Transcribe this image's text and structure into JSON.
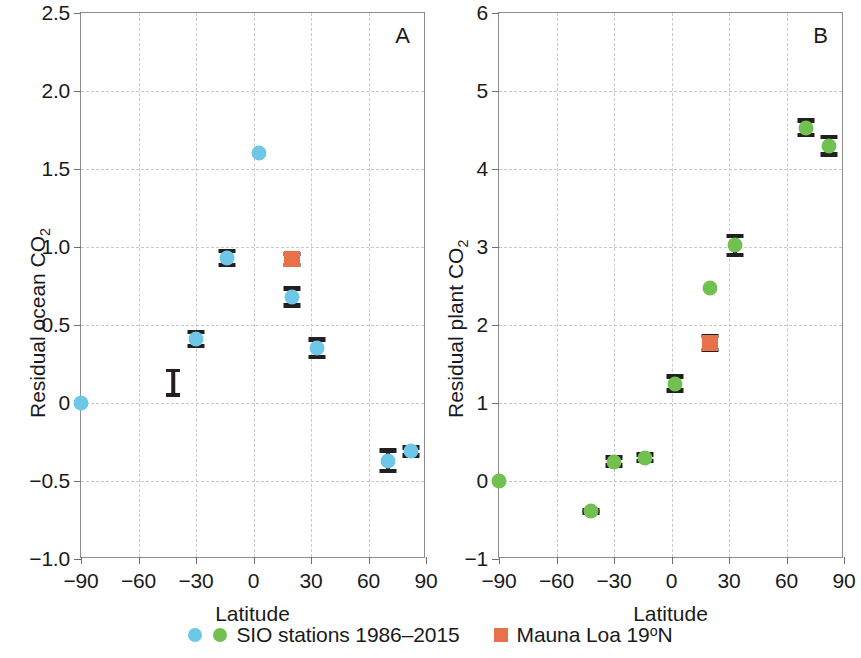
{
  "figure": {
    "width": 861,
    "height": 658,
    "colors": {
      "ocean_blue": "#6FC7E8",
      "plant_green": "#72C150",
      "mauna_loa_orange": "#E8714A",
      "errorbar_black": "#231f20",
      "grid_gray": "#c9c9c9",
      "axis_gray": "#8d8d8d"
    }
  },
  "legend": {
    "items": [
      {
        "id": "sio-stations",
        "marker": "circle-pair",
        "marker_colors": [
          "#6FC7E8",
          "#72C150"
        ],
        "label": "SIO stations 1986–2015"
      },
      {
        "id": "mauna-loa",
        "marker": "square",
        "marker_colors": [
          "#E8714A"
        ],
        "label_prefix": "Mauna Loa 19",
        "label_sup": "o",
        "label_suffix": "N",
        "label": "Mauna Loa 19°N"
      }
    ]
  },
  "chart_data": [
    {
      "id": "panel-a",
      "panel_letter": "A",
      "type": "scatter",
      "title": "",
      "xlabel": "Latitude",
      "ylabel_prefix": "Residual ocean CO",
      "ylabel_sub": "2",
      "ylabel": "Residual ocean CO2",
      "xlim": [
        -90,
        90
      ],
      "ylim": [
        -1.0,
        2.5
      ],
      "xticks": [
        -90,
        -60,
        -30,
        0,
        30,
        60,
        90
      ],
      "xticklabels": [
        "−90",
        "−60",
        "−30",
        "0",
        "30",
        "60",
        "90"
      ],
      "yticks": [
        -1.0,
        -0.5,
        0,
        0.5,
        1.0,
        1.5,
        2.0,
        2.5
      ],
      "yticklabels": [
        "−1.0",
        "−0.5",
        "0",
        "0.5",
        "1.0",
        "1.5",
        "2.0",
        "2.5"
      ],
      "grid": true,
      "series": [
        {
          "name": "SIO stations 1986–2015",
          "color": "#6FC7E8",
          "marker": "circle",
          "points": [
            {
              "x": -90,
              "y": 0.0,
              "yerr": 0.0
            },
            {
              "x": -30,
              "y": 0.41,
              "yerr": 0.06
            },
            {
              "x": -14,
              "y": 0.93,
              "yerr": 0.06
            },
            {
              "x": 3,
              "y": 1.6,
              "yerr": 0.0
            },
            {
              "x": 20,
              "y": 0.68,
              "yerr": 0.07
            },
            {
              "x": 33,
              "y": 0.35,
              "yerr": 0.07
            },
            {
              "x": 70,
              "y": -0.37,
              "yerr": 0.08
            },
            {
              "x": 82,
              "y": -0.31,
              "yerr": 0.04
            }
          ]
        },
        {
          "name": "Mauna Loa 19°N",
          "color": "#E8714A",
          "marker": "square",
          "points": [
            {
              "x": 20,
              "y": 0.92,
              "yerr": 0.05
            }
          ]
        }
      ],
      "scale_indicator": {
        "x": -42,
        "y": 0.13,
        "half_height": 0.09
      }
    },
    {
      "id": "panel-b",
      "panel_letter": "B",
      "type": "scatter",
      "title": "",
      "xlabel": "Latitude",
      "ylabel_prefix": "Residual plant CO",
      "ylabel_sub": "2",
      "ylabel": "Residual plant CO2",
      "xlim": [
        -90,
        90
      ],
      "ylim": [
        -1,
        6
      ],
      "xticks": [
        -90,
        -60,
        -30,
        0,
        30,
        60,
        90
      ],
      "xticklabels": [
        "−90",
        "−60",
        "−30",
        "0",
        "30",
        "60",
        "90"
      ],
      "yticks": [
        -1,
        0,
        1,
        2,
        3,
        4,
        5,
        6
      ],
      "yticklabels": [
        "−1",
        "0",
        "1",
        "2",
        "3",
        "4",
        "5",
        "6"
      ],
      "grid": true,
      "series": [
        {
          "name": "SIO stations 1986–2015",
          "color": "#72C150",
          "marker": "circle",
          "points": [
            {
              "x": -90,
              "y": 0.0,
              "yerr": 0.0
            },
            {
              "x": -42,
              "y": -0.39,
              "yerr": 0.04
            },
            {
              "x": -30,
              "y": 0.25,
              "yerr": 0.08
            },
            {
              "x": -14,
              "y": 0.3,
              "yerr": 0.07
            },
            {
              "x": 2,
              "y": 1.25,
              "yerr": 0.12
            },
            {
              "x": 20,
              "y": 2.48,
              "yerr": 0.0
            },
            {
              "x": 33,
              "y": 3.02,
              "yerr": 0.15
            },
            {
              "x": 70,
              "y": 4.53,
              "yerr": 0.12
            },
            {
              "x": 82,
              "y": 4.3,
              "yerr": 0.14
            }
          ]
        },
        {
          "name": "Mauna Loa 19°N",
          "color": "#E8714A",
          "marker": "square",
          "points": [
            {
              "x": 20,
              "y": 1.77,
              "yerr": 0.12
            }
          ]
        }
      ]
    }
  ]
}
